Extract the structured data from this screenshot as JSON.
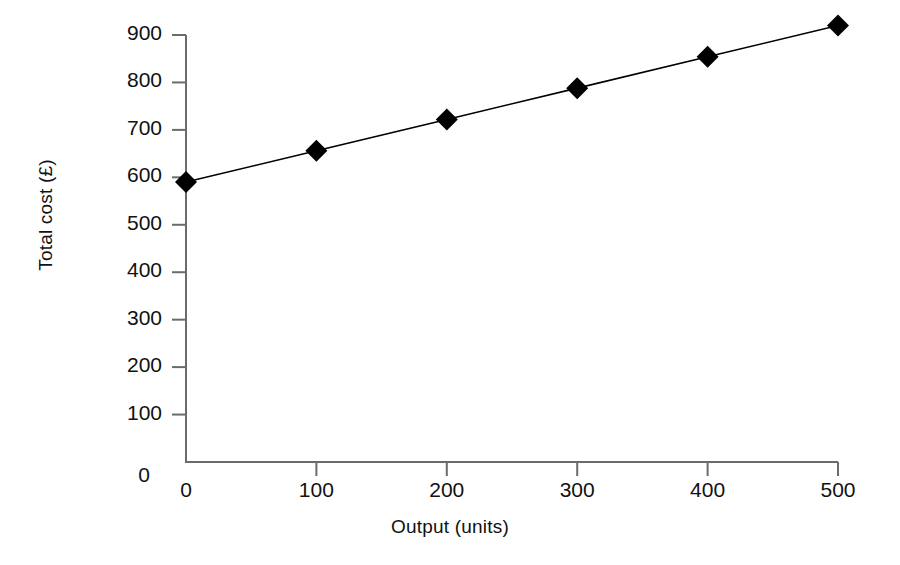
{
  "chart_data": {
    "type": "line",
    "title": "",
    "subtitle": "",
    "xlabel": "Output (units)",
    "ylabel": "Total cost (£)",
    "x": [
      0,
      100,
      200,
      300,
      400,
      500
    ],
    "values": [
      590,
      656,
      722,
      788,
      854,
      920
    ],
    "series": [
      {
        "name": "Total cost",
        "x": [
          0,
          100,
          200,
          300,
          400,
          500
        ],
        "values": [
          590,
          656,
          722,
          788,
          854,
          920
        ],
        "marker": "filled-diamond",
        "marker_color": "#000000",
        "line_color": "#000000"
      }
    ],
    "xlim": [
      0,
      500
    ],
    "ylim": [
      0,
      900
    ],
    "xticks": [
      0,
      100,
      200,
      300,
      400,
      500
    ],
    "yticks": [
      0,
      100,
      200,
      300,
      400,
      500,
      600,
      700,
      800,
      900
    ],
    "xtick_labels": [
      "0",
      "100",
      "200",
      "300",
      "400",
      "500"
    ],
    "ytick_labels": [
      "0",
      "100",
      "200",
      "300",
      "400",
      "500",
      "600",
      "700",
      "800",
      "900"
    ],
    "grid": false,
    "legend": "none",
    "annotations": []
  },
  "axes": {
    "y_title": "Total cost (£)",
    "x_title": "Output (units)",
    "axis_color": "#6b6b6b",
    "text_color": "#111111"
  }
}
